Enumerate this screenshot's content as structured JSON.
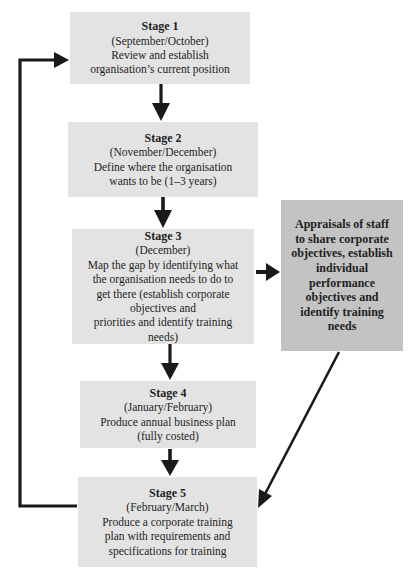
{
  "diagram": {
    "type": "flowchart",
    "colors": {
      "stage_box": "#e3e3e3",
      "appraisal_box": "#c3c3c3",
      "arrow": "#1a1a1a",
      "text": "#1e1e1e"
    },
    "stages": [
      {
        "title": "Stage 1",
        "period": "(September/October)",
        "lines": [
          "Review and establish",
          "organisation’s current position"
        ]
      },
      {
        "title": "Stage 2",
        "period": "(November/December)",
        "lines": [
          "Define where the organisation",
          "wants to be (1–3 years)"
        ]
      },
      {
        "title": "Stage 3",
        "period": "(December)",
        "lines": [
          "Map the gap by identifying what",
          "the organisation needs to do to",
          "get there (establish corporate",
          "objectives and",
          "priorities and identify training",
          "needs)"
        ]
      },
      {
        "title": "Stage 4",
        "period": "(January/February)",
        "lines": [
          "Produce annual business plan",
          "(fully costed)"
        ]
      },
      {
        "title": "Stage 5",
        "period": "(February/March)",
        "lines": [
          "Produce a corporate training",
          "plan with requirements and",
          "specifications for training"
        ]
      }
    ],
    "appraisal": {
      "lines": [
        "Appraisals of staff",
        "to share corporate",
        "objectives, establish",
        "individual",
        "performance",
        "objectives and",
        "identify training",
        "needs"
      ]
    },
    "connections": [
      {
        "from": "Stage 1",
        "to": "Stage 2"
      },
      {
        "from": "Stage 2",
        "to": "Stage 3"
      },
      {
        "from": "Stage 3",
        "to": "Stage 4"
      },
      {
        "from": "Stage 3",
        "to": "Appraisals"
      },
      {
        "from": "Stage 4",
        "to": "Stage 5"
      },
      {
        "from": "Appraisals",
        "to": "Stage 5"
      },
      {
        "from": "Stage 5",
        "to": "Stage 1",
        "style": "loop-back"
      }
    ]
  }
}
